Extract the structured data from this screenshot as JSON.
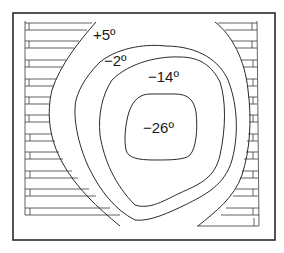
{
  "diagram": {
    "type": "contour-map",
    "contours": [
      {
        "id": "outer",
        "label": "+5º"
      },
      {
        "id": "second",
        "label": "−2º"
      },
      {
        "id": "third",
        "label": "−14º"
      },
      {
        "id": "inner",
        "label": "−26º"
      }
    ],
    "colors": {
      "line": "#2a2a2a",
      "background": "#ffffff"
    }
  }
}
